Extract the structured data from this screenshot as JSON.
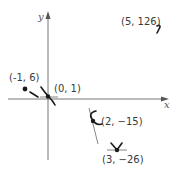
{
  "figure": {
    "type": "coordinate-plot-with-tangent-sketches",
    "axes": {
      "x_label": "x",
      "y_label": "y"
    },
    "points": [
      {
        "label": "(-1, 6)",
        "x": -1,
        "y": 6
      },
      {
        "label": "(0, 1)",
        "x": 0,
        "y": 1
      },
      {
        "label": "(2, −15)",
        "x": 2,
        "y": -15
      },
      {
        "label": "(3, −26)",
        "x": 3,
        "y": -26
      },
      {
        "label": "(5, 126)",
        "x": 5,
        "y": 126
      }
    ],
    "colors": {
      "axis": "#777777",
      "marks": "#1a1a1a",
      "text": "#3a3a3a"
    }
  }
}
